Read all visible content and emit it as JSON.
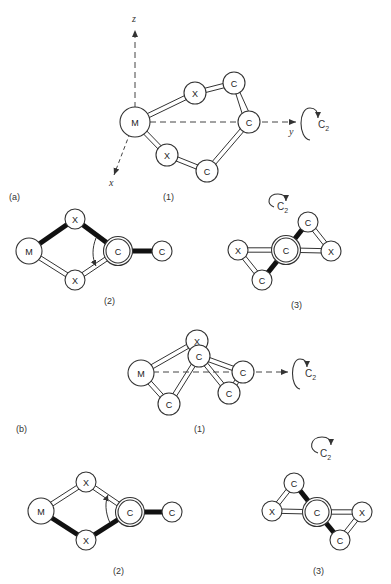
{
  "panels": {
    "a": {
      "label": "(a)",
      "views": [
        {
          "label": "(1)",
          "axes": {
            "z": "z",
            "y": "y",
            "x": "x"
          },
          "symmetry": "C2",
          "atoms": [
            {
              "id": "M",
              "text": "M"
            },
            {
              "id": "X1",
              "text": "X"
            },
            {
              "id": "C1",
              "text": "C"
            },
            {
              "id": "C2",
              "text": "C"
            },
            {
              "id": "X2",
              "text": "X"
            },
            {
              "id": "C3",
              "text": "C"
            }
          ]
        },
        {
          "label": "(2)",
          "atoms": [
            {
              "id": "M",
              "text": "M"
            },
            {
              "id": "X1",
              "text": "X"
            },
            {
              "id": "C1",
              "text": "C"
            },
            {
              "id": "C2",
              "text": "C"
            },
            {
              "id": "X2",
              "text": "X"
            }
          ]
        },
        {
          "label": "(3)",
          "symmetry": "C2",
          "atoms": [
            {
              "id": "X1",
              "text": "X"
            },
            {
              "id": "C1",
              "text": "C"
            },
            {
              "id": "X2",
              "text": "X"
            },
            {
              "id": "C2",
              "text": "C"
            },
            {
              "id": "C3",
              "text": "C"
            }
          ]
        }
      ]
    },
    "b": {
      "label": "(b)",
      "views": [
        {
          "label": "(1)",
          "symmetry": "C2",
          "atoms": [
            {
              "id": "M",
              "text": "M"
            },
            {
              "id": "X1",
              "text": "X"
            },
            {
              "id": "C1",
              "text": "C"
            },
            {
              "id": "C2",
              "text": "C"
            },
            {
              "id": "C3",
              "text": "C"
            },
            {
              "id": "C4",
              "text": "C"
            }
          ]
        },
        {
          "label": "(2)",
          "atoms": [
            {
              "id": "M",
              "text": "M"
            },
            {
              "id": "X1",
              "text": "X"
            },
            {
              "id": "C1",
              "text": "C"
            },
            {
              "id": "C2",
              "text": "C"
            },
            {
              "id": "X2",
              "text": "X"
            }
          ]
        },
        {
          "label": "(3)",
          "symmetry": "C2",
          "atoms": [
            {
              "id": "X1",
              "text": "X"
            },
            {
              "id": "C1",
              "text": "C"
            },
            {
              "id": "C2",
              "text": "C"
            },
            {
              "id": "X2",
              "text": "X"
            },
            {
              "id": "C3",
              "text": "C"
            }
          ]
        }
      ]
    }
  },
  "symbols": {
    "c2_main": "C",
    "c2_sub": "2"
  }
}
